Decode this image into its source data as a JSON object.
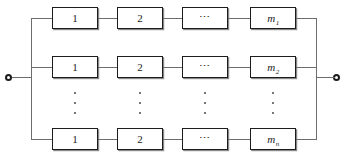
{
  "diagram": {
    "type": "reliability-block-diagram",
    "terminals": {
      "left": "input-terminal",
      "right": "output-terminal"
    },
    "branches": [
      {
        "id": "branch-1",
        "blocks": [
          {
            "label": "1",
            "style": "plain"
          },
          {
            "label": "2",
            "style": "plain"
          },
          {
            "label": "⋯",
            "style": "dots"
          },
          {
            "label": "m",
            "sub": "1",
            "style": "italic"
          }
        ]
      },
      {
        "id": "branch-2",
        "blocks": [
          {
            "label": "1",
            "style": "plain"
          },
          {
            "label": "2",
            "style": "plain"
          },
          {
            "label": "⋯",
            "style": "dots"
          },
          {
            "label": "m",
            "sub": "2",
            "style": "italic"
          }
        ]
      },
      {
        "id": "branch-n",
        "blocks": [
          {
            "label": "1",
            "style": "plain"
          },
          {
            "label": "2",
            "style": "plain"
          },
          {
            "label": "⋯",
            "style": "dots"
          },
          {
            "label": "m",
            "sub": "n",
            "style": "italic"
          }
        ]
      }
    ],
    "column_ellipses": [
      {
        "column": "1"
      },
      {
        "column": "2"
      },
      {
        "column": "3"
      },
      {
        "column": "4"
      }
    ],
    "colors": {
      "line": "#6d6d6d",
      "block_border": "#1c1c1c",
      "text": "#1a1a1a",
      "background": "#ffffff"
    }
  }
}
